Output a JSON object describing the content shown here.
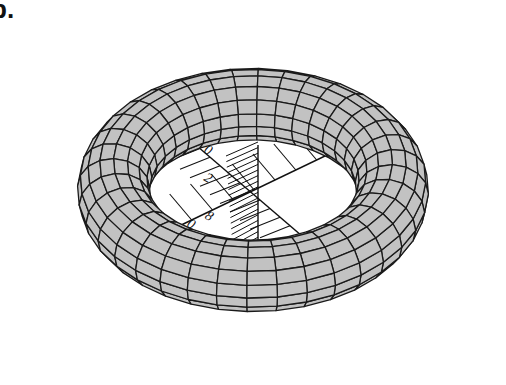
{
  "figure": {
    "panel_label": "b.",
    "title": "",
    "colors": {
      "surface": "#c2c2c2",
      "mesh_line": "#1a1a1a",
      "background": "#ffffff",
      "axis": "#111111"
    },
    "torus": {
      "center_x": 253,
      "center_y": 190,
      "major_radius": 168,
      "minor_radius": 70,
      "tilt_deg": 52,
      "rotation_deg": -8,
      "u_segments": 36,
      "v_segments": 16
    },
    "axes": {
      "tick_labels": [
        "0",
        "2",
        "8",
        "0"
      ],
      "ruler_1_ticks": 14,
      "ruler_2_ticks": 12,
      "hatched_block_lines": 20
    }
  }
}
